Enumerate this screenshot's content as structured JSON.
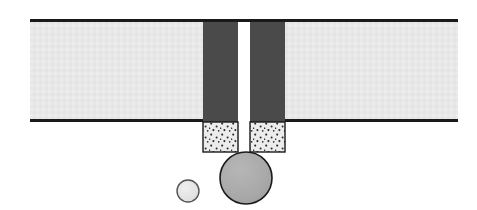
{
  "figure": {
    "title": "Cross-section schematic of a slot nozzle with detaching droplets",
    "canvas": {
      "width": 477,
      "height": 210,
      "background": "#ffffff"
    },
    "colors": {
      "substrate_fill": "#e8e8e8",
      "substrate_line": "#1a1a1a",
      "wall_fill": "#4a4a4a",
      "stipple_fill": "#ececec",
      "stipple_dot": "#2b2b2b",
      "stipple_outline": "#1a1a1a",
      "large_drop_fill": "#a8a8a8",
      "large_drop_outline": "#1a1a1a",
      "small_drop_fill": "#e2e2e2",
      "small_drop_outline": "#4a4a4a",
      "background": "#ffffff"
    },
    "parts": [
      {
        "id": "substrate-left",
        "name": "substrate-left-band",
        "shape": "rect",
        "x": 30,
        "y": 21,
        "width": 173,
        "height": 101,
        "fill": "#e8e8e8"
      },
      {
        "id": "substrate-right",
        "name": "substrate-right-band",
        "shape": "rect",
        "x": 285,
        "y": 21,
        "width": 173,
        "height": 101,
        "fill": "#e8e8e8"
      },
      {
        "id": "line-top",
        "name": "substrate-top-edge-line",
        "shape": "line",
        "x1": 30,
        "y1": 20.5,
        "x2": 458,
        "y2": 20.5,
        "stroke": "#1a1a1a",
        "stroke_width": 3
      },
      {
        "id": "line-bottom-left",
        "name": "substrate-bottom-edge-line-left",
        "shape": "line",
        "x1": 30,
        "y1": 120.5,
        "x2": 203,
        "y2": 120.5,
        "stroke": "#1a1a1a",
        "stroke_width": 3
      },
      {
        "id": "line-bottom-right",
        "name": "substrate-bottom-edge-line-right",
        "shape": "line",
        "x1": 285,
        "y1": 120.5,
        "x2": 458,
        "y2": 120.5,
        "stroke": "#1a1a1a",
        "stroke_width": 3
      },
      {
        "id": "wall-left",
        "name": "nozzle-wall-left",
        "shape": "rect",
        "x": 203,
        "y": 20,
        "width": 35,
        "height": 102,
        "fill": "#4a4a4a"
      },
      {
        "id": "wall-right",
        "name": "nozzle-wall-right",
        "shape": "rect",
        "x": 250,
        "y": 20,
        "width": 35,
        "height": 102,
        "fill": "#4a4a4a"
      },
      {
        "id": "stipple-left",
        "name": "stippled-deposit-left",
        "shape": "rect",
        "x": 203,
        "y": 122,
        "width": 35,
        "height": 30,
        "fill": "#ececec",
        "stroke": "#1a1a1a",
        "stroke_width": 1.4,
        "pattern": "stipple"
      },
      {
        "id": "stipple-right",
        "name": "stippled-deposit-right",
        "shape": "rect",
        "x": 250,
        "y": 122,
        "width": 35,
        "height": 30,
        "fill": "#ececec",
        "stroke": "#1a1a1a",
        "stroke_width": 1.4,
        "pattern": "stipple"
      },
      {
        "id": "drop-large",
        "name": "large-droplet",
        "shape": "circle",
        "cx": 246,
        "cy": 178,
        "r": 26,
        "fill": "#a8a8a8",
        "stroke": "#1a1a1a",
        "stroke_width": 1.6
      },
      {
        "id": "drop-small",
        "name": "small-droplet",
        "shape": "circle",
        "cx": 188,
        "cy": 191,
        "r": 11,
        "fill": "#e2e2e2",
        "stroke": "#4a4a4a",
        "stroke_width": 1.4
      }
    ],
    "gap": {
      "name": "nozzle-slot-gap",
      "x": 238,
      "width": 12,
      "y_top": 20,
      "y_bottom": 152
    }
  }
}
